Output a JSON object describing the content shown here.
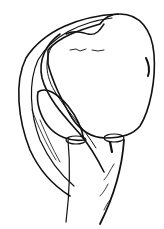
{
  "illustration": {
    "subject": "anatomical line drawing",
    "background_color": "#ffffff",
    "ink_color": "#111111",
    "signature": ""
  }
}
